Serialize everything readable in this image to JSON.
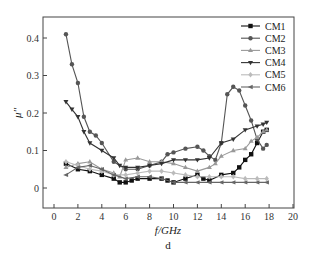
{
  "chart_data": {
    "type": "line",
    "title": "",
    "panel_label": "d",
    "xlabel": "f/GHz",
    "ylabel": "μ''",
    "xlim": [
      -1,
      20
    ],
    "ylim": [
      -0.055,
      0.455
    ],
    "xticks": [
      0,
      2,
      4,
      6,
      8,
      10,
      12,
      14,
      16,
      18,
      20
    ],
    "yticks": [
      0,
      0.1,
      0.2,
      0.3,
      0.4
    ],
    "ytick_labels": [
      "0",
      "0.1",
      "0.2",
      "0.3",
      "0.4"
    ],
    "grid": false,
    "legend_position": "upper right",
    "series": [
      {
        "name": "CM1",
        "color": "#111111",
        "marker": "square",
        "x": [
          1,
          2,
          3,
          4,
          5,
          5.5,
          6,
          6.5,
          7,
          8,
          9,
          9.5,
          10,
          11,
          12,
          12.5,
          13,
          14,
          15,
          15.5,
          16,
          16.5,
          17,
          17.5,
          17.8
        ],
        "y": [
          0.065,
          0.05,
          0.045,
          0.035,
          0.025,
          0.015,
          0.015,
          0.02,
          0.025,
          0.025,
          0.025,
          0.02,
          0.015,
          0.025,
          0.035,
          0.025,
          0.02,
          0.035,
          0.04,
          0.055,
          0.075,
          0.09,
          0.12,
          0.15,
          0.155
        ]
      },
      {
        "name": "CM2",
        "color": "#555555",
        "marker": "circle",
        "x": [
          1,
          1.5,
          2,
          2.5,
          3,
          3.5,
          4,
          5,
          6,
          7,
          8,
          9,
          9.5,
          10,
          11,
          12,
          12.5,
          13,
          13.5,
          14,
          14.5,
          15,
          15.5,
          16,
          16.5,
          17,
          17.5,
          17.8
        ],
        "y": [
          0.41,
          0.33,
          0.28,
          0.19,
          0.15,
          0.14,
          0.12,
          0.07,
          0.05,
          0.05,
          0.06,
          0.07,
          0.09,
          0.095,
          0.105,
          0.11,
          0.1,
          0.085,
          0.075,
          0.12,
          0.25,
          0.27,
          0.26,
          0.22,
          0.18,
          0.13,
          0.105,
          0.115
        ]
      },
      {
        "name": "CM3",
        "color": "#999999",
        "marker": "triangle-up",
        "x": [
          1,
          2,
          3,
          4,
          5,
          5.5,
          6,
          7,
          8,
          9,
          10,
          11,
          12,
          13,
          13.5,
          14,
          15,
          16,
          16.5,
          17,
          17.5,
          17.8
        ],
        "y": [
          0.055,
          0.065,
          0.07,
          0.05,
          0.04,
          0.03,
          0.075,
          0.08,
          0.07,
          0.07,
          0.065,
          0.055,
          0.045,
          0.055,
          0.065,
          0.085,
          0.1,
          0.105,
          0.125,
          0.135,
          0.15,
          0.155
        ]
      },
      {
        "name": "CM4",
        "color": "#333333",
        "marker": "triangle-down",
        "x": [
          1,
          1.5,
          2,
          2.5,
          3,
          4,
          5,
          5.5,
          6,
          7,
          8,
          9,
          10,
          11,
          12,
          13,
          14,
          15,
          16,
          17,
          17.5,
          17.8
        ],
        "y": [
          0.23,
          0.21,
          0.19,
          0.15,
          0.12,
          0.1,
          0.08,
          0.06,
          0.055,
          0.055,
          0.06,
          0.065,
          0.075,
          0.075,
          0.075,
          0.08,
          0.12,
          0.13,
          0.155,
          0.165,
          0.17,
          0.175
        ]
      },
      {
        "name": "CM5",
        "color": "#bbbbbb",
        "marker": "diamond",
        "x": [
          1,
          2,
          3,
          4,
          5,
          6,
          7,
          8,
          9,
          10,
          11,
          12,
          13,
          14,
          15,
          16,
          17,
          17.8
        ],
        "y": [
          0.07,
          0.06,
          0.05,
          0.045,
          0.035,
          0.035,
          0.04,
          0.045,
          0.045,
          0.04,
          0.035,
          0.03,
          0.03,
          0.03,
          0.03,
          0.025,
          0.025,
          0.025
        ]
      },
      {
        "name": "CM6",
        "color": "#666666",
        "marker": "star",
        "x": [
          1,
          2,
          3,
          4,
          5,
          6,
          7,
          8,
          9,
          10,
          11,
          12,
          13,
          14,
          15,
          16,
          17,
          17.8
        ],
        "y": [
          0.035,
          0.055,
          0.06,
          0.05,
          0.035,
          0.025,
          0.03,
          0.03,
          0.025,
          0.015,
          0.015,
          0.015,
          0.015,
          0.015,
          0.015,
          0.015,
          0.015,
          0.015
        ]
      }
    ]
  }
}
